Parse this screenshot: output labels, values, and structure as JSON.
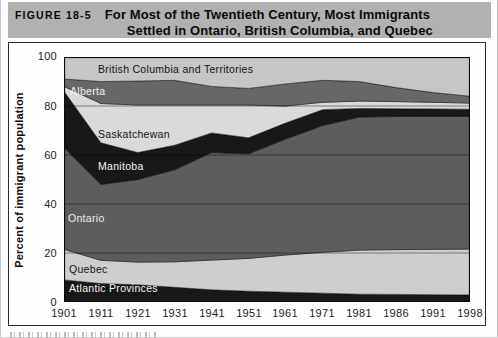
{
  "figure_header": {
    "tag": "FIGURE 18-5",
    "title_line1": "For Most of the Twentieth Century, Most Immigrants",
    "title_line2": "Settled in Ontario, British Columbia, and Quebec"
  },
  "chart_data": {
    "type": "area",
    "stacked": true,
    "ylabel": "Percent of immigrant population",
    "xlabel": "",
    "ylim": [
      0,
      100
    ],
    "y_ticks": [
      "100",
      "80",
      "60",
      "40",
      "20",
      "0"
    ],
    "gridlines": [
      20,
      40,
      60,
      80
    ],
    "grid": true,
    "legend_position": "labels-inside-areas",
    "x_labels": [
      "1901",
      "1911",
      "1921",
      "1931",
      "1941",
      "1951",
      "1961",
      "1971",
      "1981",
      "1986",
      "1991",
      "1998"
    ],
    "series": [
      {
        "name": "Atlantic Provinces",
        "values": [
          9,
          7.5,
          7,
          6,
          5,
          4.4,
          4,
          3.6,
          3.2,
          3.1,
          3,
          2.9
        ],
        "color": "#181818",
        "label": {
          "x": 5,
          "y": 235,
          "color": "#f5f5f5"
        }
      },
      {
        "name": "Quebec",
        "values": [
          12.5,
          9.5,
          9.3,
          10.4,
          12.1,
          13.4,
          15.2,
          16.7,
          18,
          18.3,
          18.5,
          18.7
        ],
        "color": "#cecece",
        "label": {
          "x": 5,
          "y": 216,
          "color": "#141414"
        }
      },
      {
        "name": "Ontario",
        "values": [
          41.5,
          31,
          33.7,
          37.6,
          43.9,
          42.7,
          47.3,
          51.7,
          54.3,
          54.3,
          54.2,
          54.1
        ],
        "color": "#5d5d5d",
        "label": {
          "x": 4,
          "y": 165,
          "color": "#ececec"
        }
      },
      {
        "name": "Manitoba",
        "values": [
          23,
          17,
          11,
          10,
          8,
          6.5,
          6.5,
          6.5,
          3.5,
          3.2,
          3.1,
          3
        ],
        "color": "#181818",
        "label": {
          "x": 34,
          "y": 113,
          "color": "#f5f5f5"
        }
      },
      {
        "name": "Saskatchewan",
        "values": [
          2,
          16,
          19.4,
          16.4,
          11.4,
          13.4,
          7,
          3,
          3,
          2.9,
          2.7,
          2.5
        ],
        "color": "#dadada",
        "label": {
          "x": 34,
          "y": 81,
          "color": "#141414"
        }
      },
      {
        "name": "Alberta",
        "values": [
          3,
          9,
          9.8,
          10.1,
          7.6,
          6.8,
          9,
          9,
          8,
          5.7,
          4,
          2.8
        ],
        "color": "#676767",
        "label": {
          "x": 6,
          "y": 38,
          "color": "#f5f5f5"
        }
      },
      {
        "name": "British Columbia and Territories",
        "values": [
          9,
          10,
          9.8,
          9.5,
          12,
          12.8,
          11,
          9.5,
          10,
          12.5,
          14.5,
          16
        ],
        "color": "#c6c6c6",
        "label": {
          "x": 34,
          "y": 16,
          "color": "#141414"
        }
      }
    ]
  }
}
